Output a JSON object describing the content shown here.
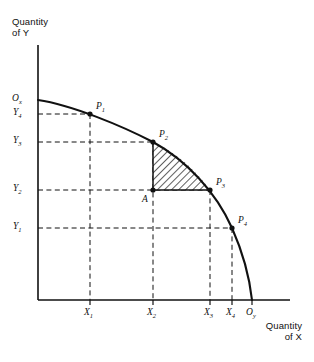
{
  "figure": {
    "kind": "production-possibilities-frontier",
    "background_color": "#ffffff",
    "ink_color": "#111111",
    "width": 314,
    "height": 362
  },
  "axes": {
    "y_title": "Quantity\nof Y",
    "x_title": "Quantity\nof X",
    "origin_y_label": "O",
    "origin_y_sub": "x",
    "origin_x_label": "O",
    "origin_x_sub": "y",
    "y_ticks": [
      {
        "label": "Y",
        "sub": "4",
        "value": 114
      },
      {
        "label": "Y",
        "sub": "3",
        "value": 142
      },
      {
        "label": "Y",
        "sub": "2",
        "value": 190
      },
      {
        "label": "Y",
        "sub": "1",
        "value": 228
      }
    ],
    "x_ticks": [
      {
        "label": "X",
        "sub": "1",
        "value": 90
      },
      {
        "label": "X",
        "sub": "2",
        "value": 153
      },
      {
        "label": "X",
        "sub": "3",
        "value": 210
      },
      {
        "label": "X",
        "sub": "4",
        "value": 232
      }
    ]
  },
  "curve": {
    "name": "production-possibilities-curve",
    "start_x": 38,
    "start_y": 100,
    "end_x": 252,
    "end_y": 300,
    "stroke_width": 2.1,
    "color": "#111111"
  },
  "points": [
    {
      "id": "P1",
      "label": "P",
      "sub": "1",
      "x": 90,
      "y": 114,
      "label_dx": 6,
      "label_dy": -13
    },
    {
      "id": "P2",
      "label": "P",
      "sub": "2",
      "x": 153,
      "y": 142,
      "label_dx": 6,
      "label_dy": -13
    },
    {
      "id": "P3",
      "label": "P",
      "sub": "3",
      "x": 210,
      "y": 190,
      "label_dx": 6,
      "label_dy": -13
    },
    {
      "id": "P4",
      "label": "P",
      "sub": "4",
      "x": 232,
      "y": 228,
      "label_dx": 6,
      "label_dy": -13
    }
  ],
  "interior_point": {
    "id": "A",
    "label": "A",
    "x": 153,
    "y": 190,
    "label_dx": -11,
    "label_dy": 4
  },
  "shaded_region": {
    "name": "opportunity-cost-region",
    "description": "hatched area bounded by P2, P3 and interior point A",
    "hatch_angle_deg": 45,
    "hatch_color": "#111111",
    "fill": "#ffffff"
  },
  "guide_lines": {
    "style": "dashed",
    "color": "#111111"
  }
}
